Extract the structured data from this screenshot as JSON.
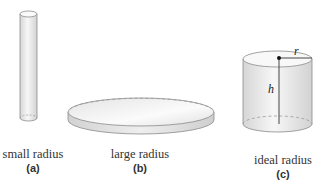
{
  "figures": [
    {
      "id": "a",
      "caption": "small radius",
      "sublabel": "(a)",
      "shape": "tall-narrow-cylinder"
    },
    {
      "id": "b",
      "caption": "large radius",
      "sublabel": "(b)",
      "shape": "wide-flat-cylinder"
    },
    {
      "id": "c",
      "caption": "ideal radius",
      "sublabel": "(c)",
      "shape": "balanced-cylinder",
      "annotations": {
        "radius": "r",
        "height": "h"
      }
    }
  ],
  "colors": {
    "outline": "#8a8a8a",
    "fill_light": "#f4f4f4",
    "fill_shade": "#d8d8d8",
    "dashed": "#999999",
    "marker": "#111111"
  }
}
